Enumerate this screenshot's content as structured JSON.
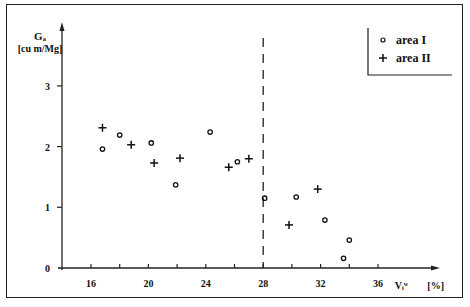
{
  "chart_data": {
    "type": "scatter",
    "title": "",
    "xlabel": "Vᵢʷ [%]",
    "ylabel": "Gₐ [cu m/Mg]",
    "ylabel_line1": "Gₐ",
    "ylabel_line2": "[cu m/Mg]",
    "xlabel_symbol": "Vᵢʷ",
    "xlabel_unit": "[%]",
    "xlim": [
      14,
      38
    ],
    "ylim": [
      0,
      3.6
    ],
    "x_ticks": [
      16,
      18,
      20,
      22,
      24,
      26,
      28,
      30,
      32,
      34,
      36
    ],
    "x_tick_labels": [
      "16",
      "20",
      "24",
      "28",
      "32",
      "36"
    ],
    "x_labeled_ticks": [
      16,
      20,
      24,
      28,
      32,
      36
    ],
    "y_ticks": [
      0,
      1,
      2,
      3
    ],
    "y_tick_labels": [
      "0",
      "1",
      "2",
      "3"
    ],
    "grid": false,
    "legend_position": "upper right",
    "reference_line": {
      "type": "vertical",
      "style": "dashed",
      "x": 28
    },
    "series": [
      {
        "name": "area I",
        "marker": "o",
        "points": [
          [
            16.8,
            1.96
          ],
          [
            18.0,
            2.19
          ],
          [
            20.2,
            2.06
          ],
          [
            21.9,
            1.37
          ],
          [
            24.3,
            2.24
          ],
          [
            26.2,
            1.75
          ],
          [
            28.1,
            1.15
          ],
          [
            30.3,
            1.17
          ],
          [
            32.3,
            0.79
          ],
          [
            34.0,
            0.46
          ],
          [
            33.6,
            0.16
          ]
        ]
      },
      {
        "name": "area II",
        "marker": "+",
        "points": [
          [
            16.8,
            2.31
          ],
          [
            18.8,
            2.03
          ],
          [
            20.4,
            1.73
          ],
          [
            22.2,
            1.81
          ],
          [
            25.6,
            1.66
          ],
          [
            27.0,
            1.8
          ],
          [
            29.8,
            0.71
          ],
          [
            31.8,
            1.3
          ]
        ]
      }
    ]
  },
  "legend": {
    "items": [
      {
        "symbol": "∘",
        "label": "area I"
      },
      {
        "symbol": "+",
        "label": "area II"
      }
    ]
  }
}
